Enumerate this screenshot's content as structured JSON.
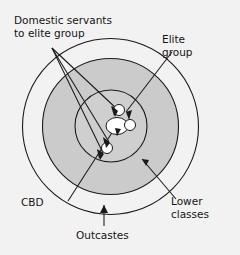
{
  "diagram": {
    "background_color": "#f2f2f2",
    "stroke_color": "#1a1a1a",
    "ring_fill_outer": "#f2f2f2",
    "ring_fill_middle": "#cccccc",
    "ring_fill_inner": "#cfcfcf",
    "core_fill": "#ffffff",
    "labels": {
      "domestic_servants_line1": "Domestic servants",
      "domestic_servants_line2": "to elite group",
      "elite_line1": "Elite",
      "elite_line2": "group",
      "cbd": "CBD",
      "outcastes": "Outcastes",
      "lower_line1": "Lower",
      "lower_line2": "classes"
    },
    "zones": [
      {
        "name": "Outcastes",
        "ring": "outer"
      },
      {
        "name": "Lower classes",
        "ring": "middle"
      },
      {
        "name": "Elite group",
        "ring": "inner"
      },
      {
        "name": "CBD",
        "ring": "core"
      },
      {
        "name": "Domestic servants to elite group",
        "ring": "core-satellites"
      }
    ]
  }
}
